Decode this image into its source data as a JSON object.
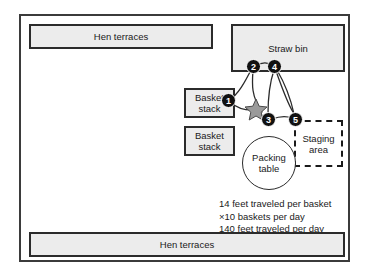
{
  "diagram": {
    "type": "spaghetti-diagram",
    "title": "",
    "areas": [
      {
        "id": "hen-terraces-top",
        "label": "Hen terraces",
        "shape": "rect",
        "fill": "#ececec"
      },
      {
        "id": "straw-bin",
        "label": "Straw bin",
        "shape": "rect",
        "fill": "#ececec"
      },
      {
        "id": "basket-stack-upper",
        "label": "Basket stack",
        "shape": "rect",
        "fill": "#ececec"
      },
      {
        "id": "basket-stack-lower",
        "label": "Basket stack",
        "shape": "rect",
        "fill": "#ececec"
      },
      {
        "id": "packing-table",
        "label": "Packing table",
        "shape": "circle",
        "fill": "#ffffff"
      },
      {
        "id": "staging-area",
        "label": "Staging area",
        "shape": "rect-dashed",
        "fill": "#ffffff"
      },
      {
        "id": "hen-terraces-bottom",
        "label": "Hen terraces",
        "shape": "rect",
        "fill": "#ececec"
      }
    ],
    "steps": [
      {
        "number": "1",
        "at": "basket-stack-upper"
      },
      {
        "number": "2",
        "at": "straw-bin"
      },
      {
        "number": "3",
        "at": "packing-table"
      },
      {
        "number": "4",
        "at": "straw-bin"
      },
      {
        "number": "5",
        "at": "staging-area"
      }
    ],
    "marker": {
      "name": "star",
      "at": "packing-table-top",
      "fill": "#9a9a9a"
    },
    "metrics": [
      "14 feet traveled per basket",
      "×10 baskets per day",
      "140 feet traveled per day"
    ],
    "colors": {
      "frame": "#3b3b3b",
      "box_fill": "#ececec",
      "box_stroke": "#2b2b2b",
      "node_fill": "#111111",
      "node_text": "#ffffff",
      "path_stroke": "#2b2b2b",
      "star_fill": "#9a9a9a"
    }
  }
}
